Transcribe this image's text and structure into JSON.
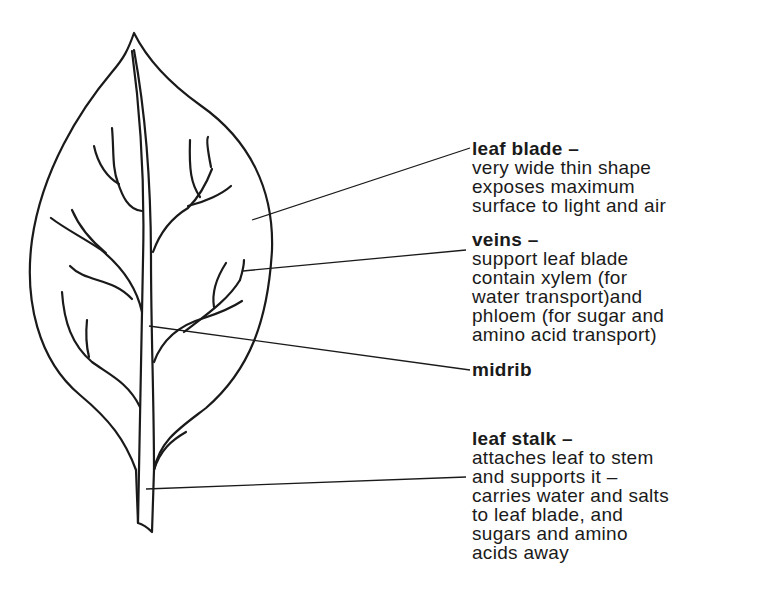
{
  "diagram": {
    "subject": "leaf",
    "ink_color": "#1a1a1a",
    "background": "#ffffff",
    "labels": [
      {
        "id": "leaf-blade",
        "title": "leaf blade –",
        "lines": [
          "very wide thin shape",
          "exposes maximum",
          "surface to light and air"
        ]
      },
      {
        "id": "veins",
        "title": "veins –",
        "lines": [
          "support leaf blade",
          "contain xylem (for",
          "water transport)and",
          "phloem (for sugar and",
          "amino acid transport)"
        ]
      },
      {
        "id": "midrib",
        "title": "midrib",
        "lines": []
      },
      {
        "id": "leaf-stalk",
        "title": "leaf stalk –",
        "lines": [
          "attaches leaf to stem",
          "and supports it –",
          "carries water and salts",
          "to leaf blade, and",
          "sugars and amino",
          "acids away"
        ]
      }
    ]
  }
}
